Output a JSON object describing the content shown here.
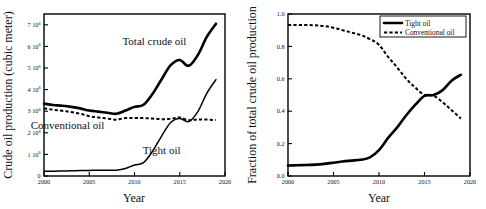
{
  "figure": {
    "panels": [
      "left",
      "right"
    ],
    "background": "#ffffff",
    "ink": "#000000"
  },
  "chart_data": [
    {
      "id": "left",
      "type": "line",
      "title": "",
      "xlabel": "Year",
      "ylabel": "Crude oil production (cubic meter)",
      "xlim": [
        2000,
        2020
      ],
      "ylim": [
        0,
        750000000
      ],
      "xticks": [
        2000,
        2005,
        2010,
        2015,
        2020
      ],
      "xticklabels": [
        "2000",
        "2005",
        "2010",
        "2015",
        "2020"
      ],
      "yticks": [
        0,
        100000000,
        200000000,
        300000000,
        400000000,
        500000000,
        600000000,
        700000000
      ],
      "yticklabels": [
        "0",
        "1 10",
        "2 10",
        "3 10",
        "4 10",
        "5 10",
        "6 10",
        "7 10"
      ],
      "ytick_exponents": [
        "",
        "8",
        "8",
        "8",
        "8",
        "8",
        "8",
        "8"
      ],
      "grid": false,
      "legend": null,
      "annotations": [
        {
          "text": "Total crude oil",
          "x": 2012.2,
          "y": 607000000
        },
        {
          "text": "Conventional oil",
          "x": 2002.6,
          "y": 218000000
        },
        {
          "text": "Tight oil",
          "x": 2013.0,
          "y": 102000000
        }
      ],
      "x": [
        2000,
        2001,
        2002,
        2003,
        2004,
        2005,
        2006,
        2007,
        2008,
        2009,
        2010,
        2011,
        2012,
        2013,
        2014,
        2015,
        2016,
        2017,
        2018,
        2019
      ],
      "series": [
        {
          "name": "Total crude oil",
          "style": "solid-thick",
          "values": [
            335000000,
            329000000,
            325000000,
            320000000,
            313000000,
            303000000,
            298000000,
            293000000,
            288000000,
            303000000,
            320000000,
            330000000,
            381000000,
            448000000,
            513000000,
            537000000,
            510000000,
            560000000,
            645000000,
            705000000
          ]
        },
        {
          "name": "Conventional oil",
          "style": "dashed",
          "values": [
            313000000,
            307000000,
            302000000,
            296000000,
            288000000,
            277000000,
            271000000,
            266000000,
            261000000,
            268000000,
            269000000,
            268000000,
            266000000,
            263000000,
            265000000,
            271000000,
            258000000,
            262000000,
            261000000,
            259000000
          ]
        },
        {
          "name": "Tight oil",
          "style": "solid-thin",
          "values": [
            22000000,
            22000000,
            23000000,
            24000000,
            25000000,
            26000000,
            27000000,
            27000000,
            27000000,
            35000000,
            51000000,
            62000000,
            115000000,
            185000000,
            248000000,
            266000000,
            252000000,
            298000000,
            384000000,
            446000000
          ]
        }
      ]
    },
    {
      "id": "right",
      "type": "line",
      "title": "",
      "xlabel": "Year",
      "ylabel": "Fraction of total crude oil production",
      "xlim": [
        2000,
        2020
      ],
      "ylim": [
        0.0,
        1.0
      ],
      "xticks": [
        2000,
        2005,
        2010,
        2015,
        2020
      ],
      "xticklabels": [
        "2000",
        "2005",
        "2010",
        "2015",
        "2020"
      ],
      "yticks": [
        0.0,
        0.2,
        0.4,
        0.6,
        0.8,
        1.0
      ],
      "yticklabels": [
        "0.0",
        "0.2",
        "0.4",
        "0.6",
        "0.8",
        "1.0"
      ],
      "grid": false,
      "legend": {
        "position": "top-right",
        "entries": [
          {
            "label": "Tight oil",
            "style": "solid-thick"
          },
          {
            "label": "Conventional oil",
            "style": "dashed"
          }
        ]
      },
      "annotations": [],
      "x": [
        2000,
        2001,
        2002,
        2003,
        2004,
        2005,
        2006,
        2007,
        2008,
        2009,
        2010,
        2011,
        2012,
        2013,
        2014,
        2015,
        2016,
        2017,
        2018,
        2019
      ],
      "series": [
        {
          "name": "Tight oil",
          "style": "solid-thick",
          "values": [
            0.065,
            0.066,
            0.068,
            0.07,
            0.075,
            0.082,
            0.09,
            0.095,
            0.1,
            0.115,
            0.16,
            0.235,
            0.3,
            0.375,
            0.44,
            0.495,
            0.5,
            0.53,
            0.59,
            0.625
          ]
        },
        {
          "name": "Conventional oil",
          "style": "dashed",
          "values": [
            0.932,
            0.932,
            0.932,
            0.93,
            0.925,
            0.915,
            0.9,
            0.885,
            0.87,
            0.845,
            0.81,
            0.735,
            0.67,
            0.6,
            0.545,
            0.5,
            0.495,
            0.455,
            0.405,
            0.355
          ]
        }
      ]
    }
  ]
}
